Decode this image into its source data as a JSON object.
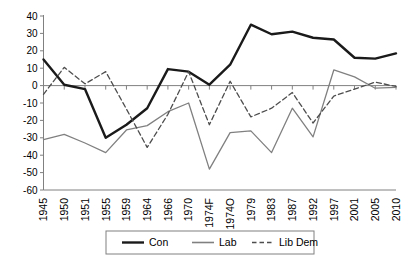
{
  "chart_data": {
    "type": "line",
    "title": "",
    "subtitle": "",
    "xlabel": "",
    "ylabel": "",
    "ylim": [
      -60,
      40
    ],
    "ytick_step": 10,
    "yticks": [
      "40",
      "30",
      "20",
      "10",
      "0",
      "-10",
      "-20",
      "-30",
      "-40",
      "-50",
      "-60"
    ],
    "grid": false,
    "legend_position": "bottom",
    "categories": [
      "1945",
      "1950",
      "1951",
      "1955",
      "1959",
      "1964",
      "1966",
      "1970",
      "1974F",
      "1974O",
      "1979",
      "1983",
      "1987",
      "1992",
      "1997",
      "2001",
      "2005",
      "2010"
    ],
    "series": [
      {
        "name": "Con",
        "style": "solid",
        "color": "#1a1a1a",
        "width": 2.4,
        "values": [
          15,
          0.5,
          -2,
          -30,
          -22.5,
          -13,
          9.5,
          8,
          0.5,
          12,
          35,
          29.5,
          31,
          27.5,
          26.5,
          16,
          15.5,
          18.5
        ]
      },
      {
        "name": "Lab",
        "style": "solid",
        "color": "#808080",
        "width": 1.3,
        "values": [
          -31,
          -28,
          -33,
          -38.5,
          -25.5,
          -23,
          -15,
          -10,
          -48,
          -27,
          -26,
          -38.5,
          -13,
          -29.5,
          9,
          5,
          -1.5,
          -1
        ]
      },
      {
        "name": "Lib Dem",
        "style": "dashed",
        "color": "#4d4d4d",
        "width": 1.3,
        "values": [
          -5,
          10.5,
          1,
          8,
          -13.5,
          -35.5,
          -16.5,
          8,
          -22.5,
          2.5,
          -18,
          -13,
          -4,
          -21.5,
          -6,
          -2,
          2,
          -0.5
        ]
      }
    ],
    "legend": [
      {
        "label": "Con",
        "style": "solid",
        "color": "#1a1a1a",
        "width": 2.4
      },
      {
        "label": "Lab",
        "style": "solid",
        "color": "#808080",
        "width": 1.6
      },
      {
        "label": "Lib Dem",
        "style": "dashed",
        "color": "#4d4d4d",
        "width": 1.3
      }
    ]
  }
}
